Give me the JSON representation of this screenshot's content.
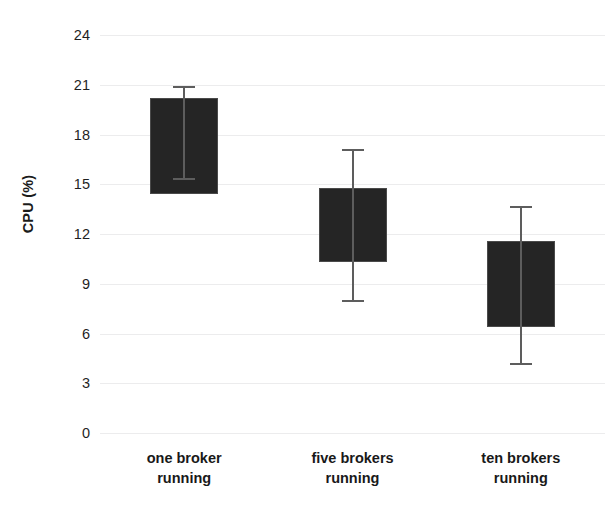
{
  "chart_data": {
    "type": "bar",
    "title": "",
    "subtitle": "",
    "xlabel": "",
    "ylabel": "CPU (%)",
    "categories": [
      "one broker\nrunning",
      "five brokers\nrunning",
      "ten brokers\nrunning"
    ],
    "series": [
      {
        "name": "CPU (%)",
        "values": [
          20.2,
          14.8,
          11.6
        ],
        "bar_base": [
          14.4,
          10.3,
          6.4
        ],
        "error_upper": [
          20.9,
          17.1,
          13.7
        ],
        "error_lower": [
          15.4,
          8.0,
          4.2
        ]
      }
    ],
    "ylim": [
      0,
      24
    ],
    "yticks": [
      0,
      3,
      6,
      9,
      12,
      15,
      18,
      21,
      24
    ],
    "ytick_labels": [
      "0",
      "3",
      "6",
      "9",
      "12",
      "15",
      "18",
      "21",
      "24"
    ],
    "grid": true,
    "legend": false,
    "legend_position": "none",
    "bar_color": "#252525",
    "bar_edge_color": "#4a4a4a",
    "error_color": "#5d5d5d",
    "gridline_color": "#ececed",
    "background_color": "#ffffff"
  },
  "axes": {
    "y_title": "CPU (%)"
  },
  "x_tick_labels": [
    "one broker\nrunning",
    "five brokers\nrunning",
    "ten brokers\nrunning"
  ],
  "y_tick_labels": [
    "24",
    "21",
    "18",
    "15",
    "12",
    "9",
    "6",
    "3",
    "0"
  ]
}
